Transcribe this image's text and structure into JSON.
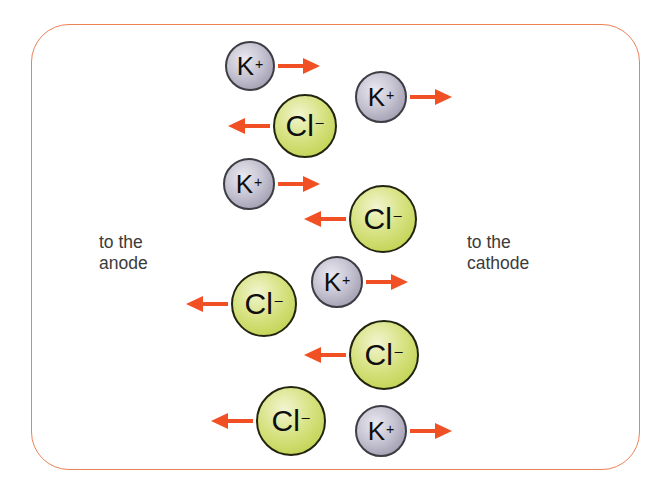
{
  "labels": {
    "anode": {
      "line1": "to the",
      "line2": "anode"
    },
    "cathode": {
      "line1": "to the",
      "line2": "cathode"
    }
  },
  "colors": {
    "arrow_color": "#f14f24",
    "frame_color": "#ec8154",
    "label_color": "#3b3b3b",
    "k_hi": "#eae9f0",
    "k_mid": "#c5c3d1",
    "k_main": "#8d8a9f",
    "k_outline": "#3d3d44",
    "cl_hi": "#f1f5d0",
    "cl_mid": "#d7e282",
    "cl_main": "#b6cc3c",
    "cl_outline": "#23240f"
  },
  "ions": [
    {
      "species": "K",
      "charge": "+",
      "x": 250,
      "y": 66,
      "r": 25,
      "arrow": "right"
    },
    {
      "species": "K",
      "charge": "+",
      "x": 381,
      "y": 97,
      "r": 26,
      "arrow": "right"
    },
    {
      "species": "Cl",
      "charge": "−",
      "x": 305,
      "y": 126,
      "r": 32,
      "arrow": "left"
    },
    {
      "species": "K",
      "charge": "+",
      "x": 249,
      "y": 184,
      "r": 26,
      "arrow": "right"
    },
    {
      "species": "Cl",
      "charge": "−",
      "x": 383,
      "y": 219,
      "r": 34,
      "arrow": "left"
    },
    {
      "species": "K",
      "charge": "+",
      "x": 337,
      "y": 282,
      "r": 26,
      "arrow": "right"
    },
    {
      "species": "Cl",
      "charge": "−",
      "x": 264,
      "y": 304,
      "r": 33,
      "arrow": "left"
    },
    {
      "species": "Cl",
      "charge": "−",
      "x": 384,
      "y": 355,
      "r": 35,
      "arrow": "left"
    },
    {
      "species": "Cl",
      "charge": "−",
      "x": 291,
      "y": 421,
      "r": 35,
      "arrow": "left"
    },
    {
      "species": "K",
      "charge": "+",
      "x": 381,
      "y": 431,
      "r": 26,
      "arrow": "right"
    }
  ]
}
